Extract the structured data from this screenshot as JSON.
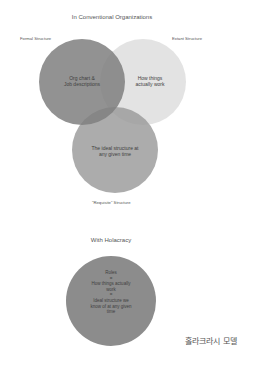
{
  "conventional": {
    "title": "In Conventional Organizations",
    "circles": [
      {
        "name": "formal",
        "label": "Formal Structure",
        "text_line1": "Org chart &",
        "text_line2": "Job descriptions",
        "color": "#8f8f8f"
      },
      {
        "name": "extant",
        "label": "Extant Structure",
        "text_line1": "How things",
        "text_line2": "actually work",
        "color": "#dedede"
      },
      {
        "name": "requisite",
        "label": "\"Requisite\" Structure",
        "text_line1": "The ideal structure at",
        "text_line2": "any given time",
        "color": "#a8a8a8"
      }
    ]
  },
  "holacracy": {
    "title": "With Holacracy",
    "color": "#8c8c8c",
    "lines": [
      "Roles",
      "=",
      "How things actually",
      "work",
      "=",
      "Ideal structure we",
      "know of at any given",
      "time"
    ]
  },
  "caption": "홀라크라시 모델"
}
